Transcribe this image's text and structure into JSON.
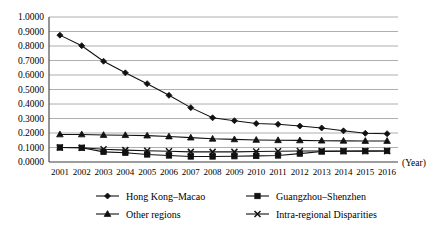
{
  "chart_data": {
    "type": "line",
    "title": "",
    "xlabel": "(Year)",
    "ylabel": "",
    "grid": true,
    "legend_position": "bottom",
    "ylim": [
      0.0,
      1.0
    ],
    "ytick_labels": [
      "1.0000",
      "0.9000",
      "0.8000",
      "0.7000",
      "0.6000",
      "0.5000",
      "0.4000",
      "0.3000",
      "0.2000",
      "0.1000",
      "0.0000"
    ],
    "ytick_values": [
      1.0,
      0.9,
      0.8,
      0.7,
      0.6,
      0.5,
      0.4,
      0.3,
      0.2,
      0.1,
      0.0
    ],
    "categories": [
      "2001",
      "2002",
      "2003",
      "2004",
      "2005",
      "2006",
      "2007",
      "2008",
      "2009",
      "2010",
      "2011",
      "2012",
      "2013",
      "2014",
      "2015",
      "2016"
    ],
    "series": [
      {
        "name": "Hong Kong–Macao",
        "marker": "diamond",
        "values": [
          0.875,
          0.802,
          0.695,
          0.615,
          0.54,
          0.46,
          0.375,
          0.305,
          0.285,
          0.265,
          0.26,
          0.248,
          0.235,
          0.215,
          0.198,
          0.195
        ]
      },
      {
        "name": "Guangzhou–Shenzhen",
        "marker": "square",
        "values": [
          0.1,
          0.098,
          0.07,
          0.064,
          0.052,
          0.045,
          0.038,
          0.038,
          0.04,
          0.042,
          0.045,
          0.058,
          0.072,
          0.074,
          0.075,
          0.076
        ]
      },
      {
        "name": "Other regions",
        "marker": "triangle",
        "values": [
          0.19,
          0.19,
          0.186,
          0.185,
          0.182,
          0.176,
          0.168,
          0.16,
          0.156,
          0.152,
          0.15,
          0.149,
          0.147,
          0.146,
          0.145,
          0.145
        ]
      },
      {
        "name": "Intra-regional Disparities",
        "marker": "x",
        "values": [
          0.1,
          0.098,
          0.088,
          0.082,
          0.078,
          0.074,
          0.07,
          0.07,
          0.07,
          0.072,
          0.074,
          0.076,
          0.076,
          0.076,
          0.076,
          0.076
        ]
      }
    ]
  }
}
